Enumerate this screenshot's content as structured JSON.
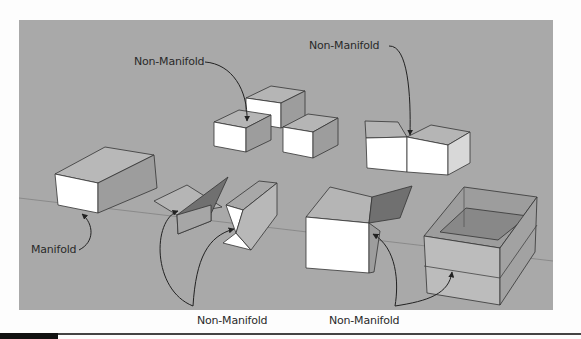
{
  "figure": {
    "background_color": "#a9a9a9",
    "labels": {
      "top_left": "Non-Manifold",
      "top_right": "Non-Manifold",
      "manifold": "Manifold",
      "bottom_left": "Non-Manifold",
      "bottom_right": "Non-Manifold"
    },
    "objects": [
      {
        "name": "solid box",
        "status": "Manifold"
      },
      {
        "name": "three stacked cubes sharing edges",
        "status": "Non-Manifold"
      },
      {
        "name": "two cubes sharing an edge",
        "status": "Non-Manifold"
      },
      {
        "name": "folded plane pair",
        "status": "Non-Manifold"
      },
      {
        "name": "bow-tie prism",
        "status": "Non-Manifold"
      },
      {
        "name": "cube with extra face",
        "status": "Non-Manifold"
      },
      {
        "name": "open box with internal face",
        "status": "Non-Manifold"
      }
    ]
  }
}
